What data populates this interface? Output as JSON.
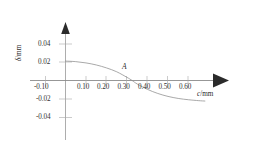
{
  "chart_data": {
    "type": "line",
    "title": "",
    "subtitle": "",
    "xlabel": "c/mm",
    "ylabel": "δ/mm",
    "xlabel_symbol": "c",
    "xlabel_unit": "/mm",
    "ylabel_symbol": "δ",
    "ylabel_unit": "/mm",
    "xlim": [
      -0.135,
      0.7
    ],
    "ylim": [
      -0.052,
      0.05
    ],
    "grid": false,
    "legend": null,
    "legend_position": "none",
    "xticks": [
      "-0.10",
      "0.10",
      "0.20",
      "0.30",
      "0.40",
      "0.50",
      "0.60"
    ],
    "xtick_values": [
      -0.1,
      0.1,
      0.2,
      0.3,
      0.4,
      0.5,
      0.6
    ],
    "yticks": [
      "0.04",
      "0.02",
      "-0.02",
      "-0.04"
    ],
    "ytick_values": [
      0.04,
      0.02,
      -0.02,
      -0.04
    ],
    "series": [
      {
        "name": "delta vs c",
        "x": [
          0.0,
          0.05,
          0.1,
          0.15,
          0.2,
          0.25,
          0.3,
          0.325,
          0.35,
          0.4,
          0.45,
          0.5,
          0.55,
          0.6,
          0.65,
          0.68
        ],
        "values": [
          0.021,
          0.0204,
          0.019,
          0.0168,
          0.0136,
          0.0094,
          0.0034,
          0.0,
          -0.0038,
          -0.0096,
          -0.014,
          -0.0172,
          -0.0194,
          -0.0208,
          -0.0218,
          -0.0222
        ]
      }
    ],
    "annotations": [
      {
        "label": "A",
        "x": 0.295,
        "y": 0.005,
        "note": "point marked on curve near zero crossing"
      }
    ],
    "colors": {
      "curve": "#8c8c8c",
      "axis": "#555555",
      "tick": "#9a9a9a",
      "text": "#2b2b2b",
      "background": "#ffffff"
    }
  }
}
